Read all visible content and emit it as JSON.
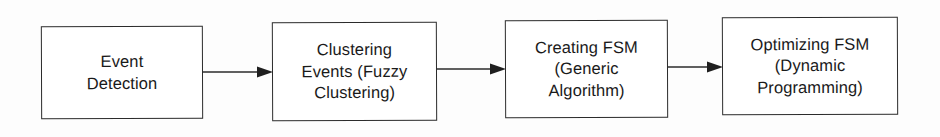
{
  "figure": {
    "type": "flowchart",
    "orientation": "left-to-right",
    "background_color": "#fdfdfd",
    "line_color": "#2b2b2b",
    "text_color": "#1a1a1a"
  },
  "nodes": [
    {
      "id": "event-detection",
      "label": "Event\nDetection",
      "shape": "rectangle",
      "order": 1
    },
    {
      "id": "clustering-events",
      "label": "Clustering\nEvents (Fuzzy\nClustering)",
      "shape": "rectangle",
      "order": 2
    },
    {
      "id": "creating-fsm",
      "label": "Creating FSM\n(Generic\nAlgorithm)",
      "shape": "rectangle",
      "order": 3
    },
    {
      "id": "optimizing-fsm",
      "label": "Optimizing FSM\n(Dynamic\nProgramming)",
      "shape": "rectangle",
      "order": 4
    }
  ],
  "edges": [
    {
      "id": "edge-1",
      "from": "event-detection",
      "to": "clustering-events",
      "style": "solid-arrow",
      "label": ""
    },
    {
      "id": "edge-2",
      "from": "clustering-events",
      "to": "creating-fsm",
      "style": "solid-arrow",
      "label": ""
    },
    {
      "id": "edge-3",
      "from": "creating-fsm",
      "to": "optimizing-fsm",
      "style": "solid-arrow",
      "label": ""
    }
  ]
}
